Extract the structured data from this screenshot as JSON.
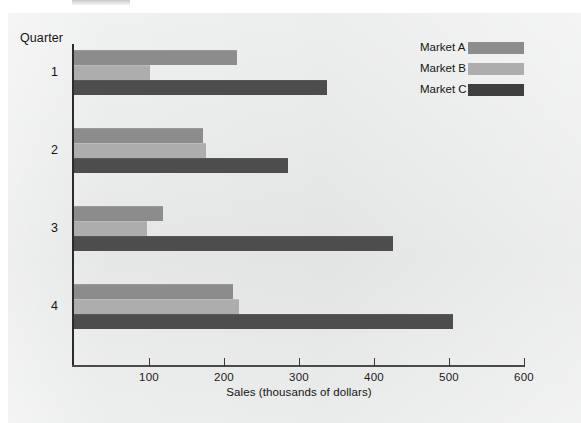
{
  "chart_data": {
    "type": "bar",
    "orientation": "horizontal",
    "title": "",
    "categories": [
      "1",
      "2",
      "3",
      "4"
    ],
    "series": [
      {
        "name": "Market A",
        "color": "#8c8c8c",
        "values": [
          217,
          172,
          119,
          212
        ]
      },
      {
        "name": "Market B",
        "color": "#adadad",
        "values": [
          101,
          176,
          97,
          220
        ]
      },
      {
        "name": "Market C",
        "color": "#4d4d4d",
        "values": [
          337,
          285,
          425,
          505
        ]
      }
    ],
    "xlabel": "Sales (thousands of dollars)",
    "ylabel": "Quarter",
    "xlim": [
      0,
      600
    ],
    "xticks": [
      100,
      200,
      300,
      400,
      500,
      600
    ],
    "xtick_labels": [
      "100",
      "200",
      "300",
      "400",
      "500",
      "600"
    ],
    "grid": false,
    "legend_position": "top-right"
  },
  "axes": {
    "y_title": "Quarter",
    "x_title": "Sales (thousands of dollars)"
  },
  "legend": {
    "items": [
      {
        "label": "Market A"
      },
      {
        "label": "Market B"
      },
      {
        "label": "Market C"
      }
    ]
  }
}
